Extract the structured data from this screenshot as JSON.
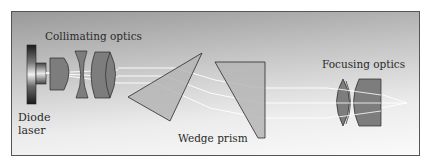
{
  "diagram": {
    "labels": {
      "collimating": "Collimating optics",
      "diode_line1": "Diode",
      "diode_line2": "laser",
      "wedge": "Wedge prism",
      "focusing": "Focusing optics"
    },
    "components": [
      {
        "name": "diode-laser",
        "label": "Diode laser"
      },
      {
        "name": "collimating-optics",
        "label": "Collimating optics",
        "elements": 3
      },
      {
        "name": "wedge-prism-1",
        "label": "Wedge prism"
      },
      {
        "name": "wedge-prism-2",
        "label": "Wedge prism"
      },
      {
        "name": "focusing-optics",
        "label": "Focusing optics",
        "elements": 2
      }
    ],
    "colors": {
      "lens_fill": "#7a7a7a",
      "lens_stroke": "#2a2a2a",
      "prism_fill": "#b0b0b0",
      "beam": "#ffffff",
      "frame_border": "#555555"
    },
    "beam_count": 3
  }
}
